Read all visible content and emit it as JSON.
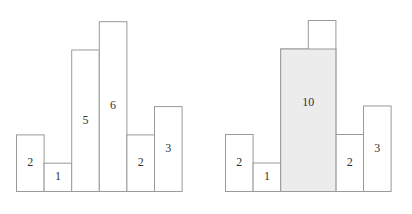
{
  "chart_data": [
    {
      "type": "bar",
      "title": "",
      "categories": [
        "0",
        "1",
        "2",
        "3",
        "4",
        "5"
      ],
      "values": [
        2,
        1,
        5,
        6,
        2,
        3
      ],
      "labels": [
        "2",
        "1",
        "5",
        "6",
        "2",
        "3"
      ],
      "xlabel": "",
      "ylabel": "",
      "ylim": [
        0,
        6
      ],
      "grid": false
    },
    {
      "type": "bar",
      "title": "",
      "categories": [
        "0",
        "1",
        "2",
        "3",
        "4",
        "5"
      ],
      "values": [
        2,
        1,
        5,
        6,
        2,
        3
      ],
      "labels": [
        "2",
        "1",
        "",
        "",
        "2",
        "3"
      ],
      "highlight": {
        "start_index": 2,
        "end_index": 3,
        "height": 5,
        "area": 10,
        "label": "10",
        "fill_color": "#ececec"
      },
      "xlabel": "",
      "ylabel": "",
      "ylim": [
        0,
        6
      ],
      "grid": false
    }
  ]
}
